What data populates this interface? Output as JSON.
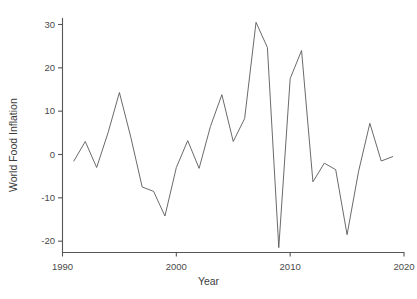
{
  "chart_data": {
    "type": "line",
    "title": "",
    "xlabel": "Year",
    "ylabel": "World Food Inflation",
    "xlim": [
      1990,
      2020
    ],
    "ylim": [
      -22.5,
      31.5
    ],
    "xticks": [
      1990,
      2000,
      2010,
      2020
    ],
    "xtick_labels": [
      "1990",
      "2000",
      "2010",
      "2020"
    ],
    "yticks": [
      30,
      20,
      10,
      0,
      -10,
      -20
    ],
    "ytick_labels": [
      "30",
      "20",
      "10",
      "0",
      "-10",
      "-20"
    ],
    "grid": false,
    "legend": false,
    "line_color": "#595959",
    "background_color": "#ffffff",
    "axis_color": "#555555",
    "x": [
      1991,
      1992,
      1993,
      1994,
      1995,
      1996,
      1997,
      1998,
      1999,
      2000,
      2001,
      2002,
      2003,
      2004,
      2005,
      2006,
      2007,
      2008,
      2009,
      2010,
      2011,
      2012,
      2013,
      2014,
      2015,
      2016,
      2017,
      2018,
      2019
    ],
    "values": [
      -1.5,
      3.0,
      -3.0,
      5.0,
      14.3,
      4.0,
      -7.5,
      -8.5,
      -14.2,
      -3.0,
      3.2,
      -3.2,
      6.5,
      13.8,
      3.0,
      8.3,
      30.5,
      24.7,
      -21.5,
      17.5,
      24.0,
      -6.3,
      -2.0,
      -3.5,
      -18.5,
      -4.0,
      7.2,
      -1.5,
      -0.5
    ],
    "series": [
      {
        "name": "World Food Inflation",
        "values": [
          -1.5,
          3.0,
          -3.0,
          5.0,
          14.3,
          4.0,
          -7.5,
          -8.5,
          -14.2,
          -3.0,
          3.2,
          -3.2,
          6.5,
          13.8,
          3.0,
          8.3,
          30.5,
          24.7,
          -21.5,
          17.5,
          24.0,
          -6.3,
          -2.0,
          -3.5,
          -18.5,
          -4.0,
          7.2,
          -1.5,
          -0.5
        ]
      }
    ]
  },
  "axes": {
    "x_title": "Year",
    "y_title": "World Food Inflation"
  }
}
